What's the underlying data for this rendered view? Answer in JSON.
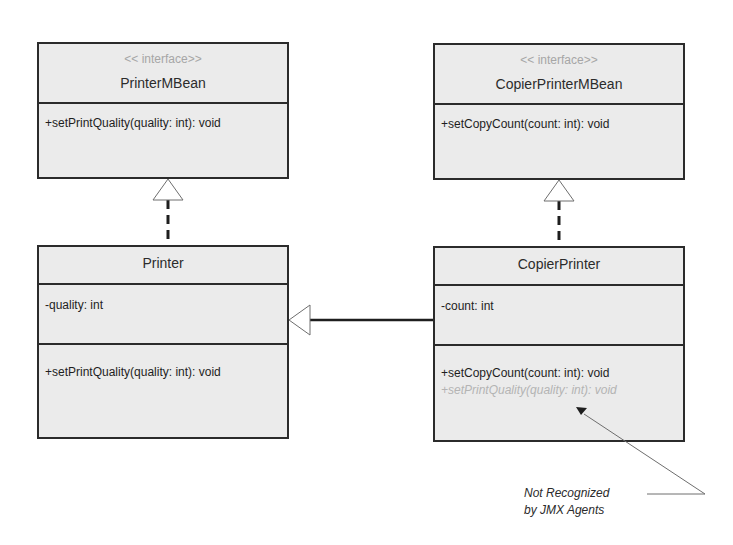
{
  "diagram": {
    "type": "UML class diagram",
    "classes": [
      {
        "id": "printer-mbean",
        "stereotype": "<< interface>>",
        "name": "PrinterMBean",
        "attributes": [],
        "operations": [
          "+setPrintQuality(quality: int): void"
        ]
      },
      {
        "id": "copier-printer-mbean",
        "stereotype": "<< interface>>",
        "name": "CopierPrinterMBean",
        "attributes": [],
        "operations": [
          "+setCopyCount(count: int): void"
        ]
      },
      {
        "id": "printer",
        "name": "Printer",
        "attributes": [
          "-quality: int"
        ],
        "operations": [
          "+setPrintQuality(quality: int): void"
        ]
      },
      {
        "id": "copier-printer",
        "name": "CopierPrinter",
        "attributes": [
          "-count: int"
        ],
        "operations": [
          "+setCopyCount(count: int): void"
        ],
        "inherited_operations": [
          "+setPrintQuality(quality: int): void"
        ]
      }
    ],
    "relationships": [
      {
        "type": "realization",
        "from": "Printer",
        "to": "PrinterMBean"
      },
      {
        "type": "realization",
        "from": "CopierPrinter",
        "to": "CopierPrinterMBean"
      },
      {
        "type": "generalization",
        "from": "CopierPrinter",
        "to": "Printer"
      }
    ],
    "note": {
      "line1": "Not Recognized",
      "line2": "by JMX Agents",
      "points_to": "+setPrintQuality(quality: int): void (in CopierPrinter)"
    },
    "colors": {
      "box_fill": "#ebebeb",
      "border": "#2b2b2b",
      "stereotype_text": "#a6a6a6",
      "ghost_text": "#b4b4b4"
    }
  }
}
